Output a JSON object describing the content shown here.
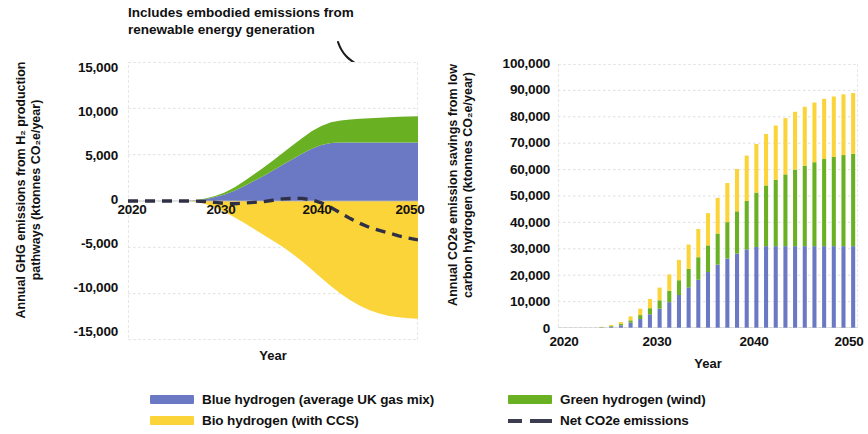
{
  "annotation": {
    "line1": "Includes embodied emissions from",
    "line2": "renewable energy generation"
  },
  "left_chart": {
    "y_axis_label_line1": "Annual GHG emissions from H₂ production",
    "y_axis_label_line2": "pathways (ktonnes CO₂e/year)",
    "x_axis_title": "Year",
    "y_ticks": [
      "15,000",
      "10,000",
      "5,000",
      "0",
      "-5,000",
      "-10,000",
      "-15,000"
    ],
    "x_ticks": [
      "2020",
      "2030",
      "2040",
      "2050"
    ]
  },
  "right_chart": {
    "y_axis_label_line1": "Annual CO2e emission savings from low",
    "y_axis_label_line2": "carbon hydrogen (ktonnes CO₂e/year)",
    "x_axis_title": "Year",
    "y_ticks": [
      "100,000",
      "90,000",
      "80,000",
      "70,000",
      "60,000",
      "50,000",
      "40,000",
      "30,000",
      "20,000",
      "10,000",
      "0"
    ],
    "x_ticks": [
      "2020",
      "2030",
      "2040",
      "2050"
    ]
  },
  "legend": {
    "items": [
      {
        "label": "Blue hydrogen (average UK gas mix)",
        "color": "#6b79c4",
        "type": "swatch"
      },
      {
        "label": "Green hydrogen (wind)",
        "color": "#6ab023",
        "type": "swatch"
      },
      {
        "label": "Bio hydrogen (with CCS)",
        "color": "#fbd43a",
        "type": "swatch"
      },
      {
        "label": "Net CO2e emissions",
        "color": "#3c3c50",
        "type": "dash"
      }
    ]
  },
  "colors": {
    "blue": "#6b79c4",
    "green": "#6ab023",
    "yellow": "#fbd43a",
    "net_line": "#2f2f45",
    "grid": "#d8d8d8",
    "plot_border": "#c9c9c9"
  },
  "chart_data": [
    {
      "type": "area",
      "title": "",
      "xlabel": "Year",
      "ylabel": "Annual GHG emissions from H2 production pathways (ktonnes CO2e/year)",
      "xlim": [
        2020,
        2050
      ],
      "ylim": [
        -15000,
        15000
      ],
      "grid": true,
      "legend_position": "bottom",
      "x": [
        2020,
        2021,
        2022,
        2023,
        2024,
        2025,
        2026,
        2027,
        2028,
        2029,
        2030,
        2031,
        2032,
        2033,
        2034,
        2035,
        2036,
        2037,
        2038,
        2039,
        2040,
        2041,
        2042,
        2043,
        2044,
        2045,
        2046,
        2047,
        2048,
        2049,
        2050
      ],
      "series": [
        {
          "name": "Blue hydrogen (average UK gas mix)",
          "color": "#6b79c4",
          "values": [
            0,
            0,
            0,
            0,
            0,
            0,
            0,
            60,
            200,
            420,
            700,
            1100,
            1600,
            2150,
            2700,
            3300,
            3900,
            4500,
            5100,
            5650,
            6050,
            6250,
            6300,
            6300,
            6300,
            6300,
            6300,
            6300,
            6300,
            6300,
            6300
          ]
        },
        {
          "name": "Green hydrogen (wind)",
          "color": "#6ab023",
          "values": [
            0,
            0,
            0,
            0,
            0,
            0,
            0,
            20,
            60,
            130,
            230,
            360,
            520,
            700,
            880,
            1080,
            1280,
            1480,
            1680,
            1880,
            2050,
            2250,
            2400,
            2500,
            2580,
            2640,
            2690,
            2740,
            2780,
            2820,
            2850
          ]
        },
        {
          "name": "Bio hydrogen (with CCS)",
          "color": "#fbd43a",
          "values": [
            0,
            0,
            0,
            0,
            0,
            0,
            0,
            -90,
            -320,
            -700,
            -1200,
            -1750,
            -2350,
            -3000,
            -3650,
            -4300,
            -4950,
            -5700,
            -6500,
            -7400,
            -8300,
            -9200,
            -10000,
            -10700,
            -11300,
            -11800,
            -12150,
            -12400,
            -12550,
            -12650,
            -12700
          ]
        }
      ],
      "net_line": {
        "name": "Net CO2e emissions",
        "color": "#2f2f45",
        "style": "dashed",
        "values": [
          0,
          0,
          0,
          0,
          0,
          0,
          0,
          -10,
          -60,
          -150,
          -270,
          -290,
          -230,
          -150,
          -70,
          80,
          230,
          280,
          280,
          130,
          -200,
          -700,
          -1300,
          -1900,
          -2420,
          -2860,
          -3160,
          -3460,
          -3760,
          -4000,
          -4200
        ]
      }
    },
    {
      "type": "bar",
      "stacked": true,
      "title": "",
      "xlabel": "Year",
      "ylabel": "Annual CO2e emission savings from low carbon hydrogen (ktonnes CO2e/year)",
      "xlim": [
        2020,
        2050
      ],
      "ylim": [
        0,
        100000
      ],
      "grid": true,
      "legend_position": "bottom",
      "categories": [
        2020,
        2021,
        2022,
        2023,
        2024,
        2025,
        2026,
        2027,
        2028,
        2029,
        2030,
        2031,
        2032,
        2033,
        2034,
        2035,
        2036,
        2037,
        2038,
        2039,
        2040,
        2041,
        2042,
        2043,
        2044,
        2045,
        2046,
        2047,
        2048,
        2049,
        2050
      ],
      "series": [
        {
          "name": "Blue hydrogen (average UK gas mix)",
          "color": "#6b79c4",
          "values": [
            0,
            0,
            0,
            0,
            200,
            500,
            1000,
            2000,
            3400,
            5200,
            7300,
            9800,
            12500,
            15400,
            18300,
            21200,
            24000,
            26300,
            28200,
            29800,
            30700,
            31000,
            31000,
            31000,
            31000,
            31000,
            31000,
            31000,
            31000,
            31000,
            31000
          ]
        },
        {
          "name": "Green hydrogen (wind)",
          "color": "#6ab023",
          "values": [
            0,
            0,
            0,
            0,
            100,
            250,
            500,
            900,
            1500,
            2300,
            3200,
            4300,
            5600,
            7000,
            8500,
            10100,
            11800,
            13800,
            16000,
            18300,
            20600,
            23000,
            25200,
            27200,
            29000,
            30500,
            31800,
            33000,
            33800,
            34500,
            35000
          ]
        },
        {
          "name": "Bio hydrogen (with CCS)",
          "color": "#fbd43a",
          "values": [
            0,
            0,
            0,
            0,
            150,
            400,
            800,
            1500,
            2400,
            3500,
            4800,
            6200,
            7700,
            9200,
            10700,
            12200,
            13500,
            14800,
            16000,
            17200,
            18400,
            19500,
            20500,
            21300,
            21900,
            22300,
            22600,
            22800,
            22900,
            23000,
            23000
          ]
        }
      ]
    }
  ]
}
